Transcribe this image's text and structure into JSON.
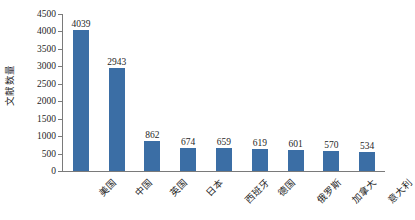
{
  "chart_data": {
    "type": "bar",
    "title": "",
    "xlabel": "",
    "ylabel": "文献数量",
    "ylim": [
      0,
      4500
    ],
    "ytick_step": 500,
    "grid": false,
    "legend": "none",
    "bar_color": "#3b6ea5",
    "axis_color": "#7a7a7a",
    "categories": [
      "美国",
      "中国",
      "英国",
      "日本",
      "西班牙",
      "德国",
      "俄罗斯",
      "加拿大",
      "意大利"
    ],
    "values": [
      4039,
      2943,
      862,
      674,
      659,
      619,
      601,
      570,
      534
    ],
    "value_labels": [
      "4039",
      "2943",
      "862",
      "674",
      "659",
      "619",
      "601",
      "570",
      "534"
    ],
    "ytick_labels": [
      "4500",
      "4000",
      "3500",
      "3000",
      "2500",
      "2000",
      "1500",
      "1000",
      "500",
      "0"
    ],
    "ytick_values": [
      4500,
      4000,
      3500,
      3000,
      2500,
      2000,
      1500,
      1000,
      500,
      0
    ]
  }
}
